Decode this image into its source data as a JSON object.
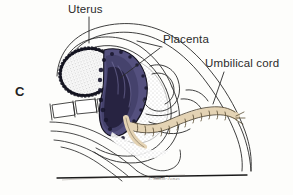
{
  "figure": {
    "panel_letter": "C",
    "background_color": "#fdfdfb",
    "ink_color": "#1c1c1c",
    "signature": "J. Smith-Jones"
  },
  "labels": [
    {
      "id": "uterus",
      "text": "Uterus",
      "leader": "vertical-line-down"
    },
    {
      "id": "placenta",
      "text": "Placenta",
      "leader": "diagonal-down-left"
    },
    {
      "id": "umbilical_cord",
      "text": "Umbilical cord",
      "leader": "diagonal-down-left"
    }
  ],
  "anatomy": {
    "placenta_color": "#54507e",
    "placenta_shadow_color": "#2a2746",
    "fetal_head_color": "#ffffff",
    "fetal_head_outline_color": "#171720",
    "umbilical_cord_color": "#e4d3b4",
    "umbilical_cord_outline_color": "#6b5a3c",
    "outline_color": "#2a2a2a",
    "baseline_color": "#1a1a1a"
  }
}
